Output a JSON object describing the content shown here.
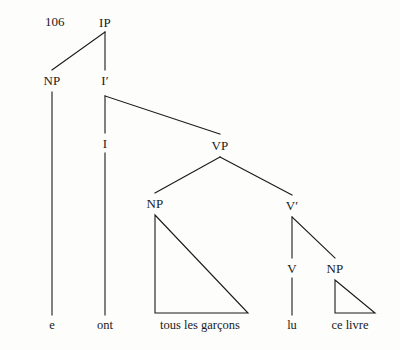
{
  "figure": {
    "number": "106",
    "type": "syntax-tree",
    "ink_color": "#1a1a1a",
    "background_color": "#fdfdfc"
  },
  "nodes": [
    {
      "id": "ip",
      "label": "IP",
      "x": 105,
      "y": 22
    },
    {
      "id": "np-subj",
      "label": "NP",
      "x": 52,
      "y": 80
    },
    {
      "id": "ibar",
      "label": "I′",
      "x": 105,
      "y": 80
    },
    {
      "id": "i",
      "label": "I",
      "x": 105,
      "y": 143
    },
    {
      "id": "vp",
      "label": "VP",
      "x": 220,
      "y": 145
    },
    {
      "id": "np-obj1",
      "label": "NP",
      "x": 155,
      "y": 203
    },
    {
      "id": "vbar",
      "label": "V′",
      "x": 292,
      "y": 205
    },
    {
      "id": "v",
      "label": "V",
      "x": 292,
      "y": 268
    },
    {
      "id": "np-obj2",
      "label": "NP",
      "x": 335,
      "y": 268
    }
  ],
  "terminals": [
    {
      "id": "t-e",
      "label": "e",
      "x": 52,
      "y": 325
    },
    {
      "id": "t-ont",
      "label": "ont",
      "x": 105,
      "y": 325
    },
    {
      "id": "t-garcons",
      "label": "tous les garçons",
      "x": 200,
      "y": 325
    },
    {
      "id": "t-lu",
      "label": "lu",
      "x": 292,
      "y": 325
    },
    {
      "id": "t-celivre",
      "label": "ce livre",
      "x": 350,
      "y": 325
    }
  ],
  "branches": [
    {
      "id": "ip-to-np",
      "x1": 105,
      "y1": 32,
      "x2": 52,
      "y2": 70
    },
    {
      "id": "ip-to-ibar",
      "x1": 105,
      "y1": 32,
      "x2": 105,
      "y2": 70
    },
    {
      "id": "np-to-e",
      "x1": 52,
      "y1": 92,
      "x2": 52,
      "y2": 315
    },
    {
      "id": "ibar-to-i",
      "x1": 105,
      "y1": 96,
      "x2": 105,
      "y2": 133
    },
    {
      "id": "ibar-to-vp",
      "x1": 105,
      "y1": 96,
      "x2": 220,
      "y2": 134
    },
    {
      "id": "i-to-ont",
      "x1": 105,
      "y1": 153,
      "x2": 105,
      "y2": 315
    },
    {
      "id": "vp-to-npobj1",
      "x1": 220,
      "y1": 157,
      "x2": 155,
      "y2": 193
    },
    {
      "id": "vp-to-vbar",
      "x1": 220,
      "y1": 157,
      "x2": 292,
      "y2": 195
    },
    {
      "id": "vbar-to-v",
      "x1": 292,
      "y1": 217,
      "x2": 292,
      "y2": 258
    },
    {
      "id": "vbar-to-npobj2",
      "x1": 292,
      "y1": 217,
      "x2": 335,
      "y2": 258
    },
    {
      "id": "v-to-lu",
      "x1": 292,
      "y1": 278,
      "x2": 292,
      "y2": 315
    }
  ],
  "triangles": [
    {
      "id": "triangle-tous-les-garcons",
      "apex_x": 155,
      "apex_y": 215,
      "left_x": 155,
      "left_y": 313,
      "right_x": 248,
      "right_y": 313
    },
    {
      "id": "triangle-ce-livre",
      "apex_x": 335,
      "apex_y": 280,
      "left_x": 335,
      "left_y": 313,
      "right_x": 375,
      "right_y": 313
    }
  ]
}
